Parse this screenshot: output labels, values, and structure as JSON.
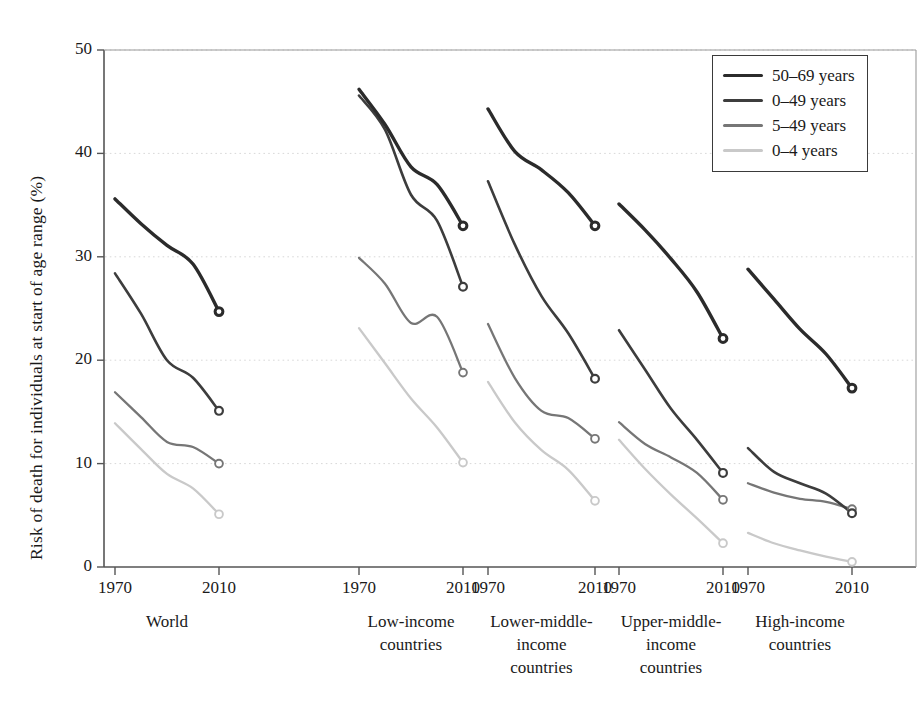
{
  "chart_data": {
    "type": "line",
    "title": "",
    "subtitle": "",
    "xlabel": "",
    "ylabel": "Risk of death for individuals at start of age range (%)",
    "ylim": [
      0,
      50
    ],
    "yticks": [
      0,
      10,
      20,
      30,
      40,
      50
    ],
    "grid": "horizontal-dotted",
    "legend_position": "top-right",
    "x": [
      1970,
      1980,
      1990,
      2000,
      2010
    ],
    "xtick_labels": [
      "1970",
      "2010"
    ],
    "panels": [
      {
        "name": "World",
        "label_lines": [
          "World"
        ],
        "series": [
          {
            "name": "50-69 years",
            "values": [
              35.6,
              33.2,
              31.1,
              29.3,
              24.7
            ]
          },
          {
            "name": "0-49 years",
            "values": [
              28.4,
              24.5,
              20.0,
              18.3,
              15.1
            ]
          },
          {
            "name": "5-49 years",
            "values": [
              16.9,
              14.5,
              12.1,
              11.6,
              10.0
            ]
          },
          {
            "name": "0-4 years",
            "values": [
              13.9,
              11.4,
              9.0,
              7.6,
              5.1
            ]
          }
        ]
      },
      {
        "name": "Low-income countries",
        "label_lines": [
          "Low-income",
          "countries"
        ],
        "series": [
          {
            "name": "50-69 years",
            "values": [
              46.2,
              42.8,
              38.7,
              37.0,
              33.0
            ]
          },
          {
            "name": "0-49 years",
            "values": [
              45.6,
              42.3,
              36.0,
              33.5,
              27.1
            ]
          },
          {
            "name": "5-49 years",
            "values": [
              29.9,
              27.4,
              23.6,
              24.2,
              18.8
            ]
          },
          {
            "name": "0-4 years",
            "values": [
              23.1,
              19.7,
              16.3,
              13.5,
              10.1
            ]
          }
        ]
      },
      {
        "name": "Lower-middle-income countries",
        "label_lines": [
          "Lower-middle-",
          "income",
          "countries"
        ],
        "series": [
          {
            "name": "50-69 years",
            "values": [
              44.3,
              40.2,
              38.4,
              36.2,
              33.0
            ]
          },
          {
            "name": "0-49 years",
            "values": [
              37.3,
              31.2,
              26.2,
              22.6,
              18.2
            ]
          },
          {
            "name": "5-49 years",
            "values": [
              23.5,
              18.3,
              15.1,
              14.4,
              12.4
            ]
          },
          {
            "name": "0-4 years",
            "values": [
              17.9,
              14.0,
              11.3,
              9.4,
              6.4
            ]
          }
        ]
      },
      {
        "name": "Upper-middle-income countries",
        "label_lines": [
          "Upper-middle-",
          "income",
          "countries"
        ],
        "series": [
          {
            "name": "50-69 years",
            "values": [
              35.1,
              32.6,
              29.8,
              26.6,
              22.1
            ]
          },
          {
            "name": "0-49 years",
            "values": [
              22.9,
              19.1,
              15.3,
              12.3,
              9.1
            ]
          },
          {
            "name": "5-49 years",
            "values": [
              14.0,
              11.9,
              10.6,
              9.1,
              6.5
            ]
          },
          {
            "name": "0-4 years",
            "values": [
              12.3,
              9.5,
              7.0,
              4.7,
              2.3
            ]
          }
        ]
      },
      {
        "name": "High-income countries",
        "label_lines": [
          "High-income",
          "countries"
        ],
        "series": [
          {
            "name": "50-69 years",
            "values": [
              28.8,
              25.9,
              23.0,
              20.6,
              17.3
            ]
          },
          {
            "name": "0-49 years",
            "values": [
              11.5,
              9.2,
              8.1,
              7.1,
              5.2
            ]
          },
          {
            "name": "5-49 years",
            "values": [
              8.1,
              7.2,
              6.6,
              6.3,
              5.6
            ]
          },
          {
            "name": "0-4 years",
            "values": [
              3.3,
              2.3,
              1.6,
              1.0,
              0.5
            ]
          }
        ]
      }
    ],
    "legend": [
      {
        "label": "50-69 years",
        "color": "#2b2b2b",
        "width": 3.4
      },
      {
        "label": "0-49 years",
        "color": "#3d3d3d",
        "width": 2.6
      },
      {
        "label": "5-49 years",
        "color": "#767676",
        "width": 2.3
      },
      {
        "label": "0-4 years",
        "color": "#c9c9c9",
        "width": 2.3
      }
    ]
  },
  "axis": {
    "y_tick_labels": [
      "50",
      "40",
      "30",
      "20",
      "10",
      "0"
    ],
    "y_axis_title": "Risk of death for individuals at start of age range (%)"
  },
  "colors": {
    "axis": "#555555",
    "grid": "#d8d8d8",
    "text": "#1a1a1a",
    "series_50_69": "#2b2b2b",
    "series_0_49": "#3d3d3d",
    "series_5_49": "#767676",
    "series_0_4": "#c9c9c9"
  }
}
